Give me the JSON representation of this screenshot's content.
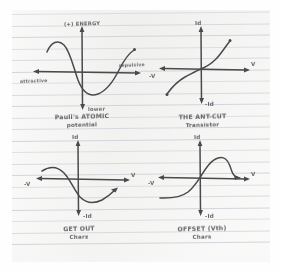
{
  "page": {
    "medium": "ruled-notebook-paper",
    "paper_color": "#f2f2f1",
    "rule_color": "#c9ccd2",
    "ink_color": "#4a4a4c",
    "rule_count": 21,
    "rule_spacing_px": 11.5
  },
  "plots": [
    {
      "id": "plot-potential-energy",
      "axes": {
        "y_top": "(+) ENERGY",
        "y_bottom": "lower",
        "x_left": "attractive",
        "x_right": "repulsive"
      },
      "caption_line1": "Pauli's  ATOMIC",
      "caption_line2": "potential",
      "curve_note": "potential-energy well: high at left, dips to minimum below axis, rises back up at right"
    },
    {
      "id": "plot-cutoff-transistor",
      "axes": {
        "y_top": "Id",
        "y_bottom": "-Id",
        "x_left": "-V",
        "x_right": "V"
      },
      "caption_line1": "THE ANT-CUT",
      "caption_line2": "Transistor",
      "curve_note": "odd / cubic S-curve passing through the origin, rising steeply at both ends"
    },
    {
      "id": "plot-get-out",
      "axes": {
        "y_top": "Id",
        "y_bottom": "-Id",
        "x_left": "-V",
        "x_right": "V"
      },
      "caption_line1": "GET OUT",
      "caption_line2": "Charz",
      "curve_note": "flat plateau upper-left, falls through the axis into a trough, then recovers upward to the right"
    },
    {
      "id": "plot-offset-chars",
      "axes": {
        "y_top": "Id",
        "y_bottom": "-Id",
        "x_left": "-V",
        "x_right": "V"
      },
      "caption_line1": "OFFSET (Vth)",
      "caption_line2": "Chars",
      "curve_note": "flat plateau lower-left, S-rise through origin to a rounded peak, then drop-off to the right"
    }
  ],
  "chart_data": {
    "type": "line",
    "panels": [
      {
        "name": "Pauli's ATOMIC potential",
        "xlabel": "attractive  ← | →  repulsive",
        "ylabel": "(+) ENERGY / lower",
        "xlim": [
          -1,
          1
        ],
        "ylim": [
          -1,
          1
        ],
        "grid": false,
        "x": [
          -1.0,
          -0.86,
          -0.72,
          -0.58,
          -0.44,
          -0.3,
          -0.16,
          -0.02,
          0.12,
          0.26,
          0.4,
          0.54,
          0.68,
          0.82,
          0.96
        ],
        "y": [
          0.42,
          0.62,
          0.58,
          0.34,
          0.02,
          -0.28,
          -0.48,
          -0.56,
          -0.55,
          -0.46,
          -0.28,
          -0.05,
          0.16,
          0.3,
          0.4
        ]
      },
      {
        "name": "THE ANT-CUT Transistor",
        "xlabel": "-V | V",
        "ylabel": "Id | -Id",
        "xlim": [
          -1,
          1
        ],
        "ylim": [
          -1,
          1
        ],
        "grid": false,
        "x": [
          -0.95,
          -0.8,
          -0.65,
          -0.5,
          -0.35,
          -0.2,
          -0.05,
          0.1,
          0.25,
          0.4,
          0.55,
          0.7,
          0.82
        ],
        "y": [
          -0.78,
          -0.58,
          -0.44,
          -0.34,
          -0.25,
          -0.16,
          -0.04,
          0.06,
          0.14,
          0.24,
          0.38,
          0.6,
          0.8
        ]
      },
      {
        "name": "GET OUT Charz",
        "xlabel": "-V | V",
        "ylabel": "Id | -Id",
        "xlim": [
          -1,
          1
        ],
        "ylim": [
          -1,
          1
        ],
        "grid": false,
        "x": [
          -0.88,
          -0.74,
          -0.6,
          -0.46,
          -0.32,
          -0.18,
          -0.04,
          0.1,
          0.24,
          0.38,
          0.52,
          0.66,
          0.78
        ],
        "y": [
          0.18,
          0.2,
          0.16,
          0.02,
          -0.2,
          -0.42,
          -0.56,
          -0.62,
          -0.6,
          -0.52,
          -0.38,
          -0.22,
          -0.1
        ]
      },
      {
        "name": "OFFSET (Vth) Chars",
        "xlabel": "-V | V",
        "ylabel": "Id | -Id",
        "xlim": [
          -1,
          1
        ],
        "ylim": [
          -1,
          1
        ],
        "grid": false,
        "x": [
          -0.92,
          -0.76,
          -0.6,
          -0.44,
          -0.28,
          -0.12,
          0.04,
          0.18,
          0.32,
          0.46,
          0.6,
          0.72,
          0.84
        ],
        "y": [
          -0.42,
          -0.44,
          -0.42,
          -0.32,
          -0.1,
          0.2,
          0.46,
          0.6,
          0.62,
          0.5,
          0.14,
          0.02,
          0.04
        ]
      }
    ]
  }
}
